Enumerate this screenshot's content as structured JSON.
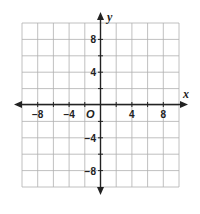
{
  "chart_data": {
    "type": "coordinate-grid",
    "title": "",
    "xlabel": "x",
    "ylabel": "y",
    "origin_label": "O",
    "xlim": [
      -10,
      10
    ],
    "ylim": [
      -10,
      10
    ],
    "grid": true,
    "grid_step": 2,
    "x_ticks": [
      {
        "value": -8,
        "label": "−8"
      },
      {
        "value": -4,
        "label": "−4"
      },
      {
        "value": 4,
        "label": "4"
      },
      {
        "value": 8,
        "label": "8"
      }
    ],
    "y_ticks": [
      {
        "value": 8,
        "label": "8"
      },
      {
        "value": 4,
        "label": "4"
      },
      {
        "value": -4,
        "label": "−4"
      },
      {
        "value": -8,
        "label": "−8"
      }
    ],
    "series": []
  },
  "colors": {
    "grid": "#b0b0b0",
    "axis": "#222222",
    "background": "#ffffff"
  }
}
